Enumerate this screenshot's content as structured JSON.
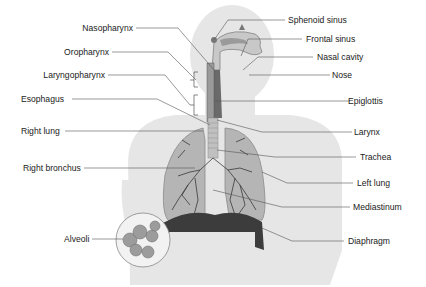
{
  "diagram": {
    "labels_left": [
      {
        "key": "nasopharynx",
        "text": "Nasopharynx"
      },
      {
        "key": "oropharynx",
        "text": "Oropharynx"
      },
      {
        "key": "laryngopharynx",
        "text": "Laryngopharynx"
      },
      {
        "key": "esophagus",
        "text": "Esophagus"
      },
      {
        "key": "right_lung",
        "text": "Right lung"
      },
      {
        "key": "right_bronchus",
        "text": "Right bronchus"
      },
      {
        "key": "alveoli",
        "text": "Alveoli"
      }
    ],
    "labels_right": [
      {
        "key": "sphenoid_sinus",
        "text": "Sphenoid sinus"
      },
      {
        "key": "frontal_sinus",
        "text": "Frontal sinus"
      },
      {
        "key": "nasal_cavity",
        "text": "Nasal cavity"
      },
      {
        "key": "nose",
        "text": "Nose"
      },
      {
        "key": "epiglottis",
        "text": "Epiglottis"
      },
      {
        "key": "larynx",
        "text": "Larynx"
      },
      {
        "key": "trachea",
        "text": "Trachea"
      },
      {
        "key": "left_lung",
        "text": "Left lung"
      },
      {
        "key": "mediastinum",
        "text": "Mediastinum"
      },
      {
        "key": "diaphragm",
        "text": "Diaphragm"
      }
    ],
    "colors": {
      "silhouette": "#e6e6e6",
      "lung": "#b5b5b5",
      "lung_outline": "#8a8a8a",
      "bronchi": "#3a3a3a",
      "diaphragm": "#3c3c3c",
      "leader": "#555555",
      "text": "#1a1a1a"
    }
  }
}
